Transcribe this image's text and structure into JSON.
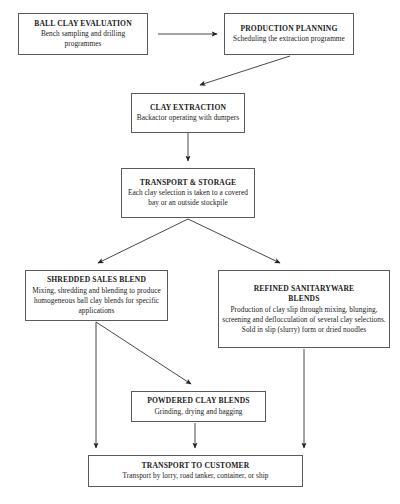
{
  "diagram": {
    "type": "flowchart",
    "style": {
      "box_border_color": "#5a5a5a",
      "background_color": "#ffffff",
      "line_color": "#333333",
      "text_color": "#1a1a1a"
    },
    "nodes": [
      {
        "id": "ball-clay-evaluation",
        "title": "BALL CLAY EVALUATION",
        "desc": "Bench sampling and drilling programmes",
        "x": 18,
        "y": 13,
        "w": 130,
        "h": 42
      },
      {
        "id": "production-planning",
        "title": "PRODUCTION PLANNING",
        "desc": "Scheduling the extraction programme",
        "x": 224,
        "y": 13,
        "w": 130,
        "h": 42
      },
      {
        "id": "clay-extraction",
        "title": "CLAY EXTRACTION",
        "desc": "Backactor operating with dumpers",
        "x": 131,
        "y": 93,
        "w": 114,
        "h": 40
      },
      {
        "id": "transport-and-storage",
        "title": "TRANSPORT & STORAGE",
        "desc": "Each clay selection is taken to a covered bay or an outside stockpile",
        "x": 121,
        "y": 168,
        "w": 134,
        "h": 50
      },
      {
        "id": "shredded-sales-blend",
        "title": "SHREDDED SALES BLEND",
        "desc": "Mixing, shredding and blending to produce homogeneous ball clay blends for specific applications",
        "x": 25,
        "y": 270,
        "w": 143,
        "h": 51
      },
      {
        "id": "refined-sanitaryware-blends",
        "title": "REFINED SANITARYWARE\nBLENDS",
        "desc": "Production of clay slip through mixing, blunging, screening and deflocculation of several clay selections.",
        "desc2": "Sold in slip (slurry) form or dried noodles",
        "x": 218,
        "y": 270,
        "w": 172,
        "h": 78
      },
      {
        "id": "powdered-clay-blends",
        "title": "POWDERED CLAY BLENDS",
        "desc": "Grinding, drying and bagging",
        "x": 131,
        "y": 391,
        "w": 135,
        "h": 31
      },
      {
        "id": "transport-to-customer",
        "title": "TRANSPORT TO CUSTOMER",
        "desc": "Transport by lorry, road tanker, container, or ship",
        "x": 88,
        "y": 455,
        "w": 215,
        "h": 32
      }
    ],
    "connectors": [
      {
        "id": "evaluation-to-planning",
        "from": "ball-clay-evaluation",
        "to": "production-planning",
        "kind": "horizontal-arrow"
      },
      {
        "id": "planning-to-extraction",
        "from": "production-planning",
        "to": "clay-extraction",
        "kind": "diagonal-arrow"
      },
      {
        "id": "extraction-to-storage",
        "from": "clay-extraction",
        "to": "transport-and-storage",
        "kind": "vertical-arrow"
      },
      {
        "id": "storage-to-shredded",
        "from": "transport-and-storage",
        "to": "shredded-sales-blend",
        "kind": "diagonal-arrow"
      },
      {
        "id": "storage-to-refined",
        "from": "transport-and-storage",
        "to": "refined-sanitaryware-blends",
        "kind": "diagonal-arrow"
      },
      {
        "id": "shredded-to-powdered",
        "from": "shredded-sales-blend",
        "to": "powdered-clay-blends",
        "kind": "diagonal-arrow"
      },
      {
        "id": "shredded-to-customer",
        "from": "shredded-sales-blend",
        "to": "transport-to-customer",
        "kind": "vertical-arrow"
      },
      {
        "id": "powdered-to-customer",
        "from": "powdered-clay-blends",
        "to": "transport-to-customer",
        "kind": "vertical-arrow"
      },
      {
        "id": "refined-to-customer",
        "from": "refined-sanitaryware-blends",
        "to": "transport-to-customer",
        "kind": "vertical-arrow"
      }
    ]
  }
}
